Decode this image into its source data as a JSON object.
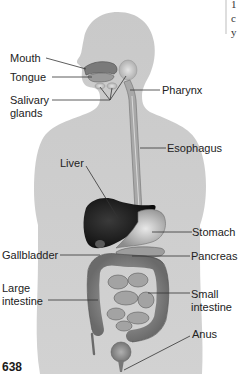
{
  "figure": {
    "type": "anatomical-diagram",
    "page_number": "638",
    "colors": {
      "body_silhouette": "#c8c8c8",
      "organ_dark": "#1a1a1a",
      "organ_mid": "#8a8a8a",
      "organ_light": "#b5b5b5",
      "label_text": "#222222",
      "leader_line": "#333333"
    },
    "labels": {
      "mouth": "Mouth",
      "tongue": "Tongue",
      "salivary_line1": "Salivary",
      "salivary_line2": "glands",
      "pharynx": "Pharynx",
      "esophagus": "Esophagus",
      "liver": "Liver",
      "stomach": "Stomach",
      "gallbladder": "Gallbladder",
      "pancreas": "Pancreas",
      "large_line1": "Large",
      "large_line2": "intestine",
      "small_line1": "Small",
      "small_line2": "intestine",
      "anus": "Anus"
    },
    "side_text_fragments": [
      "1",
      "c",
      "y"
    ]
  }
}
